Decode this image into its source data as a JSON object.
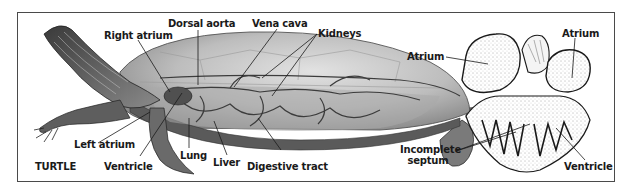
{
  "turtle": {
    "title": "TURTLE",
    "labels": {
      "right_atrium": "Right atrium",
      "dorsal_aorta": "Dorsal aorta",
      "vena_cava": "Vena cava",
      "kidneys": "Kidneys",
      "left_atrium": "Left atrium",
      "ventricle": "Ventricle",
      "lung": "Lung",
      "liver": "Liver",
      "digestive_tract": "Digestive tract"
    }
  },
  "heart": {
    "labels": {
      "atrium_left": "Atrium",
      "atrium_right": "Atrium",
      "incomplete_septum_line1": "Incomplete",
      "incomplete_septum_line2": "septum",
      "ventricle": "Ventricle"
    }
  },
  "colors": {
    "line": "#1a1a1a",
    "frame": "#4a4a4a",
    "shell": "#b9b9b9",
    "skin": "#6e6e6e",
    "vessel": "#3c3c3c"
  }
}
